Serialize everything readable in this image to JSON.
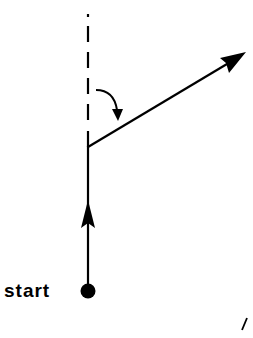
{
  "diagram": {
    "start_label": "start",
    "colors": {
      "stroke": "#000000",
      "background": "#ffffff"
    },
    "elements": [
      {
        "name": "reference-dashed-line",
        "type": "dashed-line",
        "from": [
          88,
          15
        ],
        "to": [
          88,
          145
        ]
      },
      {
        "name": "path-segment-up",
        "type": "line-with-arrow",
        "from": [
          88,
          290
        ],
        "to": [
          88,
          145
        ],
        "arrow_at": [
          88,
          205
        ]
      },
      {
        "name": "turned-direction-arrow",
        "type": "arrow",
        "from": [
          88,
          147
        ],
        "to": [
          246,
          52
        ]
      },
      {
        "name": "turn-angle-arrow",
        "type": "curved-arrow",
        "from": [
          96,
          90
        ],
        "to": [
          118,
          120
        ]
      },
      {
        "name": "start-point",
        "type": "dot",
        "center": [
          88,
          291
        ],
        "radius": 7
      },
      {
        "name": "stray-mark",
        "type": "line",
        "from": [
          247,
          318
        ],
        "to": [
          242,
          330
        ]
      }
    ]
  }
}
